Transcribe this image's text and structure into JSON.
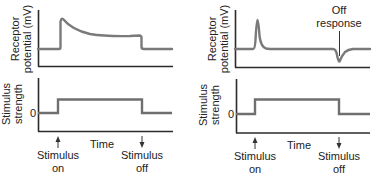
{
  "panels": [
    {
      "id": "tonic",
      "top": {
        "ylabel_line1": "Receptor",
        "ylabel_line2": "potential (mV)",
        "description": "Sustained (slowly adapting) receptor potential: sharp rise at stimulus on, decay to plateau, return to baseline at stimulus off"
      },
      "bottom": {
        "ylabel_line1": "Stimulus",
        "ylabel_line2": "strength",
        "zero_tick": "0",
        "xlabel": "Time"
      },
      "annotations": {
        "on_line1": "Stimulus",
        "on_line2": "on",
        "off_line1": "Stimulus",
        "off_line2": "off"
      }
    },
    {
      "id": "phasic",
      "top": {
        "ylabel_line1": "Receptor",
        "ylabel_line2": "potential (mV)",
        "off_response_line1": "Off",
        "off_response_line2": "response",
        "description": "Rapidly adapting receptor potential: brief spike at stimulus on, negative off response at stimulus off"
      },
      "bottom": {
        "ylabel_line1": "Stimulus",
        "ylabel_line2": "strength",
        "zero_tick": "0",
        "xlabel": "Time"
      },
      "annotations": {
        "on_line1": "Stimulus",
        "on_line2": "on",
        "off_line1": "Stimulus",
        "off_line2": "off"
      }
    }
  ],
  "colors": {
    "axis": "#2b2b2b",
    "trace": "#7a7a7a",
    "text": "#222222"
  }
}
